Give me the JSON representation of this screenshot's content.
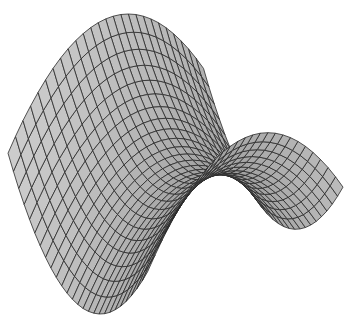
{
  "figure": {
    "kind": "3d-surface-wireframe",
    "equation": "z = y^2 - x^2",
    "grid": {
      "u_lines": 26,
      "v_lines": 26
    },
    "colors": {
      "background": "#ffffff",
      "surface_light": "#c8c8c8",
      "surface_dark": "#8a8a8a",
      "mesh_line": "#2a2a2a"
    }
  }
}
